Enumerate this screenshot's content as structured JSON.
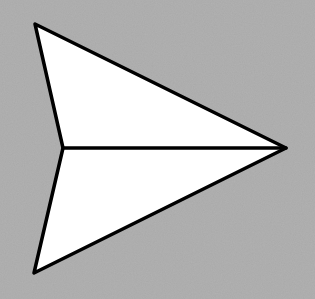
{
  "image": {
    "subject": "paper-airplane-icon",
    "background_color": "#a9a9a9",
    "fill_color": "#ffffff",
    "stroke_color": "#000000",
    "stroke_width": 3.5,
    "shape": {
      "top_vertex": [
        35,
        24
      ],
      "notch": [
        63,
        148
      ],
      "tip": [
        286,
        148
      ],
      "bottom_vertex": [
        34,
        273
      ]
    }
  }
}
